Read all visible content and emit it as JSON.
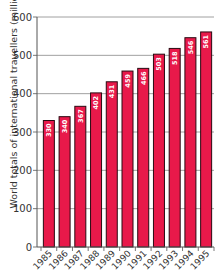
{
  "chart_data": {
    "type": "bar",
    "title": "",
    "xlabel": "",
    "ylabel": "World totals of international travellers (millions)",
    "categories": [
      "1985",
      "1986",
      "1987",
      "1988",
      "1989",
      "1990",
      "1991",
      "1992",
      "1993",
      "1994",
      "1995"
    ],
    "values": [
      330,
      340,
      367,
      402,
      431,
      459,
      466,
      503,
      518,
      546,
      561
    ],
    "ylim": [
      0,
      600
    ],
    "yticks": [
      0,
      100,
      200,
      300,
      400,
      500,
      600
    ],
    "grid": true,
    "legend": null,
    "data_labels": true,
    "bar_color": "#E8194A",
    "bar_outline": "#2a0a12",
    "grid_color": "#888888"
  }
}
